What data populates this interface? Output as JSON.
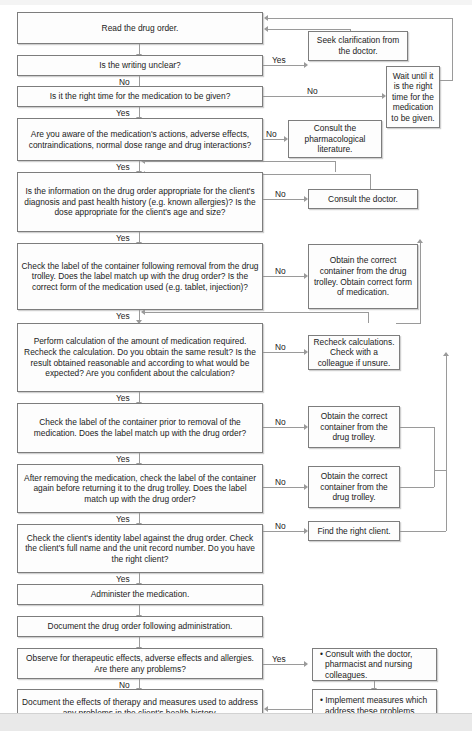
{
  "edge_labels": {
    "yes": "Yes",
    "no": "No"
  },
  "colors": {
    "box_border": "#7d7d7d",
    "box_fill": "#fdfdfd",
    "line": "#9a9a9a",
    "text": "#1b1b1b",
    "page_background": "#ffffff",
    "footer_strip": "#e9e9e9"
  },
  "main_nodes": [
    {
      "id": "read-drug-order",
      "text": "Read the drug order."
    },
    {
      "id": "writing-unclear",
      "text": "Is the writing unclear?"
    },
    {
      "id": "right-time",
      "text": "Is it the right time for the medication to be given?"
    },
    {
      "id": "aware-of-medication",
      "text": "Are you aware of the medication's actions, adverse effects, contraindications, normal dose range and drug interactions?"
    },
    {
      "id": "info-appropriate",
      "text": "Is the information on the drug order appropriate for the client's diagnosis and past health history (e.g. known allergies)? Is the dose appropriate for the client's age and size?"
    },
    {
      "id": "check-label-after-removal",
      "text": "Check the label of the container following removal from the drug trolley. Does the label match up with the drug order? Is the correct form of the medication used (e.g. tablet, injection)?"
    },
    {
      "id": "perform-calculation",
      "text": "Perform calculation of the amount of medication required. Recheck the calculation. Do you obtain the same result? Is the result obtained reasonable and according to what would be expected? Are you confident about the calculation?"
    },
    {
      "id": "check-label-prior",
      "text": "Check the label of the container prior to removal of the medication. Does the label match up with the drug order?"
    },
    {
      "id": "check-label-returning",
      "text": "After removing the medication, check the label of the container again before returning it to the drug trolley. Does the label match up with the drug order?"
    },
    {
      "id": "check-client-identity",
      "text": "Check the client's identity label against the drug order. Check the client's full name and the unit record number. Do you have the right client?"
    },
    {
      "id": "administer-medication",
      "text": "Administer the medication."
    },
    {
      "id": "document-drug-order",
      "text": "Document the drug order following administration."
    },
    {
      "id": "observe-effects",
      "text": "Observe for therapeutic effects, adverse effects and allergies. Are there any problems?"
    },
    {
      "id": "document-effects",
      "text": "Document the effects of therapy and measures used to address any problems in the client's health history."
    }
  ],
  "branch_nodes": [
    {
      "id": "seek-clarification",
      "text": "Seek clarification from the doctor."
    },
    {
      "id": "wait-until-right-time",
      "text": "Wait until it is the right time for the medication to be given."
    },
    {
      "id": "consult-pharmacological",
      "text": "Consult the pharmacological literature."
    },
    {
      "id": "consult-doctor",
      "text": "Consult the doctor."
    },
    {
      "id": "obtain-container-and-form",
      "text": "Obtain the correct container from the drug trolley. Obtain correct form of medication."
    },
    {
      "id": "recheck-calculations",
      "text": "Recheck calculations. Check with a colleague if unsure."
    },
    {
      "id": "obtain-container-1",
      "text": "Obtain the correct container from the drug trolley."
    },
    {
      "id": "obtain-container-2",
      "text": "Obtain the correct container from the drug trolley."
    },
    {
      "id": "find-right-client",
      "text": "Find the right client."
    },
    {
      "id": "consult-colleagues",
      "text": "• Consult with the doctor, pharmacist and nursing colleagues."
    },
    {
      "id": "implement-measures",
      "text": "• Implement measures which address these problems."
    }
  ]
}
